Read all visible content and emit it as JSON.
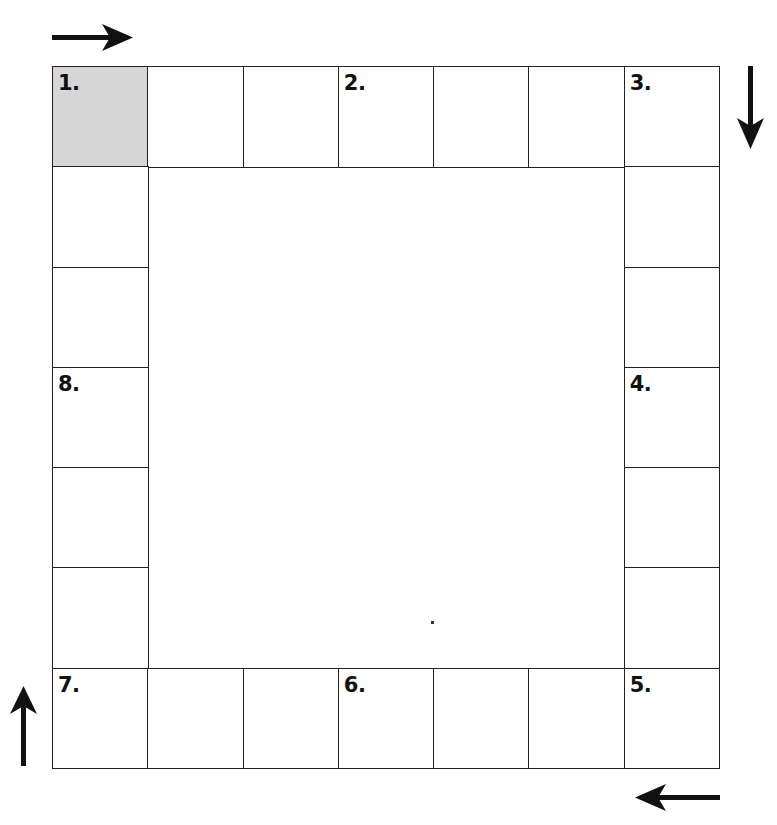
{
  "diagram": {
    "title": "",
    "grid": {
      "columns": 7,
      "rows": 7,
      "type": "perimeter-board"
    },
    "colors": {
      "line": "#222222",
      "start_fill": "#d6d6d6",
      "background": "#ffffff"
    },
    "labeled_cells": [
      {
        "label": "1.",
        "row": 0,
        "col": 0,
        "shaded": true
      },
      {
        "label": "2.",
        "row": 0,
        "col": 3
      },
      {
        "label": "3.",
        "row": 0,
        "col": 6
      },
      {
        "label": "4.",
        "row": 3,
        "col": 6
      },
      {
        "label": "5.",
        "row": 6,
        "col": 6
      },
      {
        "label": "6.",
        "row": 6,
        "col": 3
      },
      {
        "label": "7.",
        "row": 6,
        "col": 0
      },
      {
        "label": "8.",
        "row": 3,
        "col": 0
      }
    ],
    "arrows": [
      {
        "name": "arrow-right-icon",
        "position": "top-left",
        "direction": "right"
      },
      {
        "name": "arrow-down-icon",
        "position": "top-right",
        "direction": "down"
      },
      {
        "name": "arrow-left-icon",
        "position": "bottom-right",
        "direction": "left"
      },
      {
        "name": "arrow-up-icon",
        "position": "bottom-left",
        "direction": "up"
      }
    ]
  }
}
